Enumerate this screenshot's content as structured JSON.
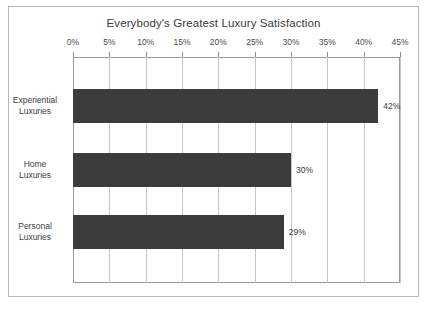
{
  "chart_data": {
    "type": "bar",
    "orientation": "horizontal",
    "title": "Everybody's Greatest Luxury Satisfaction",
    "xlabel": "",
    "ylabel": "",
    "categories": [
      "Experiential Luxuries",
      "Home Luxuries",
      "Personal Luxuries"
    ],
    "values": [
      42,
      30,
      29
    ],
    "value_labels": [
      "42%",
      "30%",
      "29%"
    ],
    "xlim": [
      0,
      45
    ],
    "xticks": [
      0,
      5,
      10,
      15,
      20,
      25,
      30,
      35,
      40,
      45
    ],
    "xtick_labels": [
      "0%",
      "5%",
      "10%",
      "15%",
      "20%",
      "25%",
      "30%",
      "35%",
      "40%",
      "45%"
    ],
    "grid": "vertical",
    "legend": null,
    "bar_color": "#3c3c3c",
    "gridline_color": "#c4c4c4",
    "frame_color": "#9a9a9a",
    "background": "#ffffff"
  },
  "category_lines": [
    [
      "Experiential",
      "Luxuries"
    ],
    [
      "Home",
      "Luxuries"
    ],
    [
      "Personal",
      "Luxuries"
    ]
  ]
}
